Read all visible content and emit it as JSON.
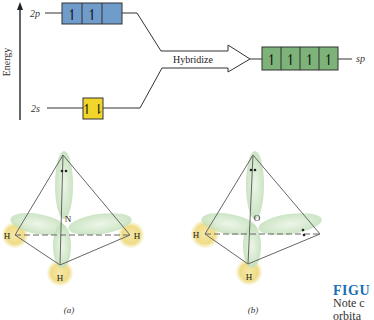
{
  "energy_diagram": {
    "axis_label": "Energy",
    "levels": {
      "p": {
        "label": "2p",
        "electrons": [
          "↿",
          "↿",
          ""
        ],
        "color": "#6f9ccb"
      },
      "s": {
        "label": "2s",
        "electrons": [
          "↿⇂"
        ],
        "color": "#f2d52b"
      },
      "hybrid": {
        "label": "sp",
        "electrons": [
          "↿",
          "↿",
          "↿",
          "↿"
        ],
        "color": "#7eb27b"
      }
    },
    "arrow_label": "Hybridize"
  },
  "molecules": [
    {
      "id": "a",
      "central_atom": "N",
      "h_labels": [
        "H",
        "H",
        "H"
      ],
      "lone_pairs": 1,
      "panel_label": "(a)"
    },
    {
      "id": "b",
      "central_atom": "O",
      "h_labels": [
        "H",
        "H"
      ],
      "lone_pairs": 2,
      "panel_label": "(b)"
    }
  ],
  "caption": {
    "title": "FIGU",
    "line1": "Note c",
    "line2": "orbita"
  },
  "colors": {
    "orbital_lobe": "#cfe6c8",
    "hydrogen": "#f3e39a",
    "line": "#555555"
  }
}
